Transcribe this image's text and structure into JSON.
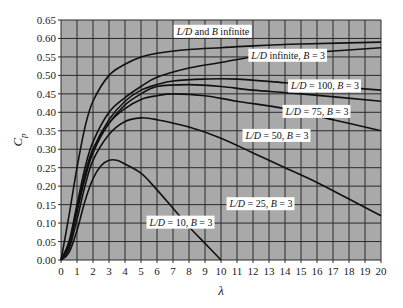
{
  "chart_data": {
    "type": "line",
    "title": "",
    "xlabel": "λ",
    "ylabel": "C_p",
    "xlim": [
      0,
      20
    ],
    "ylim": [
      0,
      0.65
    ],
    "grid": true,
    "background": "#a9a9a9",
    "line_color": "#111111",
    "x_ticks": [
      0,
      1,
      2,
      3,
      4,
      5,
      6,
      7,
      8,
      9,
      10,
      11,
      12,
      13,
      14,
      15,
      16,
      17,
      18,
      19,
      20
    ],
    "y_ticks": [
      "0.00",
      "0.05",
      "0.10",
      "0.15",
      "0.20",
      "0.25",
      "0.30",
      "0.35",
      "0.40",
      "0.45",
      "0.50",
      "0.55",
      "0.60",
      "0.65"
    ],
    "series": [
      {
        "name": "L/D and B infinite",
        "points": [
          [
            0,
            0
          ],
          [
            0.5,
            0.12
          ],
          [
            1,
            0.25
          ],
          [
            1.5,
            0.36
          ],
          [
            2,
            0.43
          ],
          [
            3,
            0.5
          ],
          [
            4,
            0.53
          ],
          [
            5,
            0.55
          ],
          [
            6,
            0.56
          ],
          [
            8,
            0.57
          ],
          [
            10,
            0.575
          ],
          [
            12,
            0.58
          ],
          [
            15,
            0.585
          ],
          [
            20,
            0.59
          ]
        ],
        "label_pos": [
          9.5,
          0.61
        ]
      },
      {
        "name": "L/D infinite, B = 3",
        "points": [
          [
            0,
            0
          ],
          [
            0.5,
            0.05
          ],
          [
            1,
            0.15
          ],
          [
            1.5,
            0.25
          ],
          [
            2,
            0.32
          ],
          [
            3,
            0.4
          ],
          [
            4,
            0.44
          ],
          [
            5,
            0.47
          ],
          [
            6,
            0.495
          ],
          [
            8,
            0.52
          ],
          [
            10,
            0.535
          ],
          [
            12,
            0.55
          ],
          [
            15,
            0.56
          ],
          [
            20,
            0.575
          ]
        ],
        "label_pos": [
          14.2,
          0.545
        ]
      },
      {
        "name": "L/D = 100, B = 3",
        "points": [
          [
            0,
            0
          ],
          [
            0.5,
            0.04
          ],
          [
            1,
            0.14
          ],
          [
            1.5,
            0.23
          ],
          [
            2,
            0.3
          ],
          [
            3,
            0.38
          ],
          [
            4,
            0.43
          ],
          [
            5,
            0.46
          ],
          [
            6,
            0.475
          ],
          [
            7,
            0.485
          ],
          [
            9,
            0.49
          ],
          [
            11,
            0.49
          ],
          [
            14,
            0.48
          ],
          [
            17,
            0.47
          ],
          [
            20,
            0.46
          ]
        ],
        "label_pos": [
          16.5,
          0.462
        ]
      },
      {
        "name": "L/D = 75, B = 3",
        "points": [
          [
            0,
            0
          ],
          [
            0.5,
            0.04
          ],
          [
            1,
            0.14
          ],
          [
            1.5,
            0.23
          ],
          [
            2,
            0.3
          ],
          [
            3,
            0.37
          ],
          [
            4,
            0.42
          ],
          [
            5,
            0.45
          ],
          [
            6,
            0.47
          ],
          [
            8,
            0.475
          ],
          [
            10,
            0.47
          ],
          [
            12,
            0.46
          ],
          [
            15,
            0.45
          ],
          [
            20,
            0.43
          ]
        ],
        "label_pos": [
          16.0,
          0.393
        ]
      },
      {
        "name": "L/D = 50, B = 3",
        "points": [
          [
            0,
            0
          ],
          [
            0.5,
            0.04
          ],
          [
            1,
            0.13
          ],
          [
            1.5,
            0.22
          ],
          [
            2,
            0.29
          ],
          [
            3,
            0.37
          ],
          [
            4,
            0.41
          ],
          [
            5,
            0.435
          ],
          [
            6,
            0.445
          ],
          [
            7,
            0.45
          ],
          [
            9,
            0.445
          ],
          [
            11,
            0.43
          ],
          [
            14,
            0.41
          ],
          [
            17,
            0.38
          ],
          [
            20,
            0.35
          ]
        ],
        "label_pos": [
          13.5,
          0.328
        ]
      },
      {
        "name": "L/D = 25, B = 3",
        "points": [
          [
            0,
            0
          ],
          [
            0.5,
            0.03
          ],
          [
            1,
            0.11
          ],
          [
            1.5,
            0.2
          ],
          [
            2,
            0.27
          ],
          [
            3,
            0.34
          ],
          [
            4,
            0.375
          ],
          [
            5,
            0.385
          ],
          [
            6,
            0.38
          ],
          [
            8,
            0.36
          ],
          [
            10,
            0.33
          ],
          [
            12,
            0.29
          ],
          [
            14,
            0.25
          ],
          [
            16,
            0.21
          ],
          [
            18,
            0.165
          ],
          [
            20,
            0.12
          ]
        ],
        "label_pos": [
          12.5,
          0.143
        ]
      },
      {
        "name": "L/D = 10, B = 3",
        "points": [
          [
            0,
            0
          ],
          [
            0.5,
            0.02
          ],
          [
            1,
            0.08
          ],
          [
            1.5,
            0.16
          ],
          [
            2,
            0.22
          ],
          [
            2.5,
            0.255
          ],
          [
            3,
            0.27
          ],
          [
            3.5,
            0.27
          ],
          [
            4,
            0.26
          ],
          [
            5,
            0.235
          ],
          [
            6,
            0.19
          ],
          [
            7,
            0.14
          ],
          [
            8,
            0.09
          ],
          [
            9,
            0.045
          ],
          [
            10,
            0.0
          ]
        ],
        "label_pos": [
          7.5,
          0.093
        ]
      }
    ]
  }
}
